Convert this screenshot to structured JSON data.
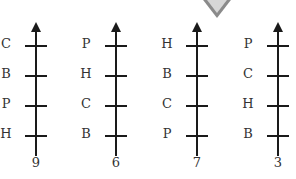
{
  "diagram": {
    "axes": [
      {
        "x": 16,
        "number": "9",
        "labels": [
          "C",
          "B",
          "P",
          "H"
        ]
      },
      {
        "x": 96,
        "number": "6",
        "labels": [
          "P",
          "H",
          "C",
          "B"
        ]
      },
      {
        "x": 177,
        "number": "7",
        "labels": [
          "H",
          "B",
          "C",
          "P"
        ]
      },
      {
        "x": 258,
        "number": "3",
        "labels": [
          "P",
          "C",
          "H",
          "B"
        ]
      }
    ],
    "tick_y": [
      45,
      75,
      105,
      135
    ],
    "selected_axis_marker": "down-triangle"
  }
}
